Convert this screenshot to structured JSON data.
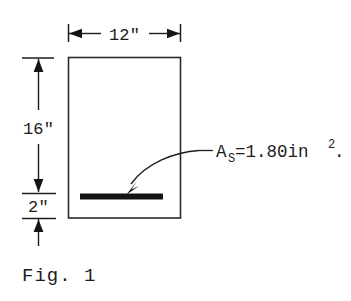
{
  "figure": {
    "caption": "Fig. 1",
    "title_alt": "Reinforced concrete beam cross-section"
  },
  "dimensions": {
    "width_label": "12\"",
    "height_label": "16\"",
    "cover_label": "2\""
  },
  "annotation": {
    "symbol": "A",
    "subscript": "S",
    "equals_value": "=1.80in",
    "superscript": "2",
    "trailing": ".",
    "full_text": "A_S=1.80in^2."
  },
  "colors": {
    "ink": "#1c1c1c",
    "rebar": "#141414",
    "background": "#ffffff"
  },
  "geometry": {
    "section_left": 68,
    "section_right": 181,
    "section_top": 57,
    "section_bottom": 218,
    "rebar_y": 196
  }
}
